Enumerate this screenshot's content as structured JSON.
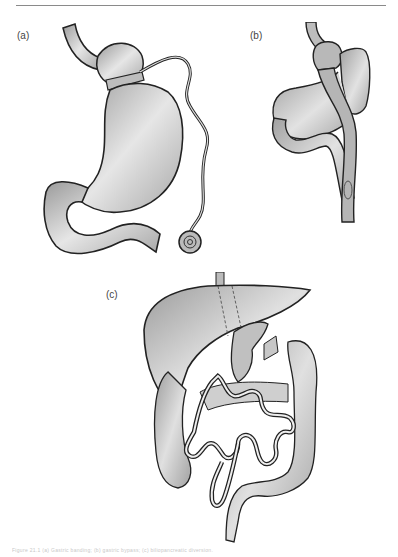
{
  "page": {
    "panels": [
      {
        "id": "a",
        "label": "(a)",
        "subject": "adjustable gastric band with access port"
      },
      {
        "id": "b",
        "label": "(b)",
        "subject": "Roux-en-Y gastric bypass"
      },
      {
        "id": "c",
        "label": "(c)",
        "subject": "biliopancreatic diversion / intestinal bypass"
      }
    ],
    "caption": "Figure 21.1 (a) Gastric banding; (b) gastric bypass; (c) biliopancreatic diversion.",
    "colors": {
      "organ_fill": "#c9c9c9",
      "organ_fill_dark": "#a8a8a8",
      "outline": "#222222",
      "rule": "#8a8a8a"
    }
  }
}
